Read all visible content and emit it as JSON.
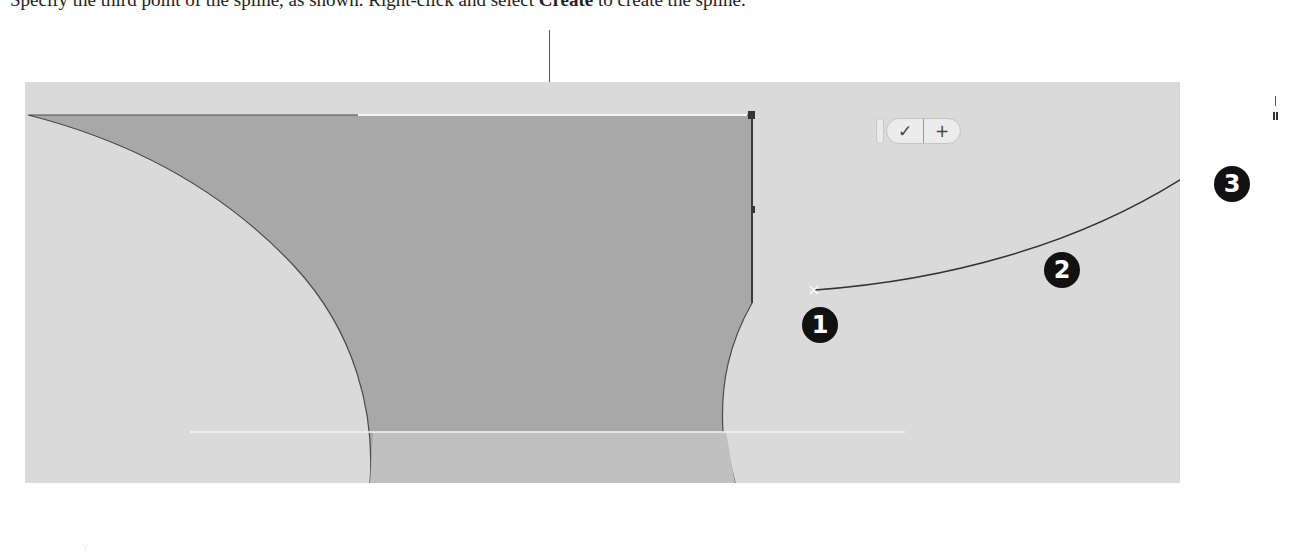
{
  "caption": {
    "before": "Specify the third point of the spline, as shown. Right-click and select ",
    "bold": "Create",
    "after": " to create the spline."
  },
  "viewport": {
    "background": "#dadada",
    "shape_fill": "#a9a9a9",
    "shape_lower_fill": "#c2c2c2",
    "edge_color": "#4a4a4a"
  },
  "toolbar": {
    "ok_glyph": "✓",
    "add_glyph": "+"
  },
  "callouts": [
    {
      "label": "1"
    },
    {
      "label": "2"
    },
    {
      "label": "3"
    }
  ],
  "triad_glyph": "Y"
}
